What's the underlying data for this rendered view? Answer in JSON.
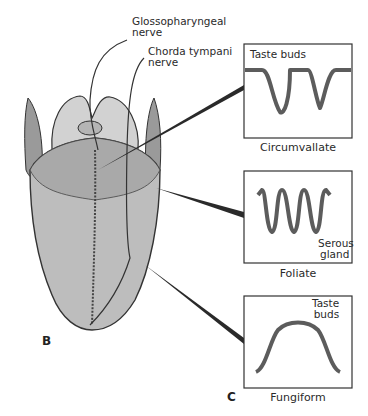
{
  "figure": {
    "panel_labels": {
      "b": "B",
      "c": "C"
    },
    "nerve_labels": {
      "glossopharyngeal_line1": "Glossopharyngeal",
      "glossopharyngeal_line2": "nerve",
      "chorda_line1": "Chorda tympani",
      "chorda_line2": "nerve"
    },
    "insets": [
      {
        "name": "Circumvallate",
        "annotation": "Taste buds"
      },
      {
        "name": "Foliate",
        "annotation_line1": "Serous",
        "annotation_line2": "gland"
      },
      {
        "name": "Fungiform",
        "annotation_line1": "Taste",
        "annotation_line2": "buds"
      }
    ],
    "colors": {
      "tongue_fill": "#bdbdbd",
      "epiglottis_fill": "#d2d2d2",
      "outline": "#333333",
      "background": "#ffffff"
    }
  }
}
